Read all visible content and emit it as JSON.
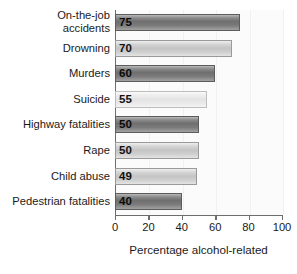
{
  "chart_data": {
    "type": "bar",
    "orientation": "horizontal",
    "title": "",
    "xlabel": "Percentage alcohol-related",
    "ylabel": "",
    "xlim": [
      0,
      100
    ],
    "xticks": [
      0,
      20,
      40,
      60,
      80,
      100
    ],
    "xtick_labels": [
      "0",
      "20",
      "40",
      "60",
      "80",
      "100"
    ],
    "grid": false,
    "legend": null,
    "categories": [
      "On-the-job accidents",
      "Drowning",
      "Murders",
      "Suicide",
      "Highway fatalities",
      "Rape",
      "Child abuse",
      "Pedestrian fatalities"
    ],
    "values": [
      75,
      70,
      60,
      55,
      50,
      50,
      49,
      40
    ],
    "data_labels": [
      "75",
      "70",
      "60",
      "55",
      "50",
      "50",
      "49",
      "40"
    ],
    "bar_shades": [
      "dark",
      "light",
      "dark",
      "pale",
      "dark",
      "light",
      "light",
      "dark"
    ]
  },
  "rows": [
    {
      "label_line1": "On-the-job",
      "label_line2": "accidents",
      "value": 75,
      "value_label": "75",
      "shade": "dark"
    },
    {
      "label_line1": "Drowning",
      "label_line2": "",
      "value": 70,
      "value_label": "70",
      "shade": "light"
    },
    {
      "label_line1": "Murders",
      "label_line2": "",
      "value": 60,
      "value_label": "60",
      "shade": "dark"
    },
    {
      "label_line1": "Suicide",
      "label_line2": "",
      "value": 55,
      "value_label": "55",
      "shade": "pale"
    },
    {
      "label_line1": "Highway fatalities",
      "label_line2": "",
      "value": 50,
      "value_label": "50",
      "shade": "dark"
    },
    {
      "label_line1": "Rape",
      "label_line2": "",
      "value": 50,
      "value_label": "50",
      "shade": "light"
    },
    {
      "label_line1": "Child abuse",
      "label_line2": "",
      "value": 49,
      "value_label": "49",
      "shade": "light"
    },
    {
      "label_line1": "Pedestrian fatalities",
      "label_line2": "",
      "value": 40,
      "value_label": "40",
      "shade": "dark"
    }
  ],
  "axis": {
    "title": "Percentage alcohol-related",
    "ticks": [
      "0",
      "20",
      "40",
      "60",
      "80",
      "100"
    ]
  },
  "colors": {
    "axis_line": "#6d6d6d",
    "bar_dark": "#6f6f6f",
    "bar_light": "#c4c4c4",
    "bar_pale": "#e3e3e3",
    "text": "#1a1a1a",
    "plot_background": "#fbfbfc"
  }
}
